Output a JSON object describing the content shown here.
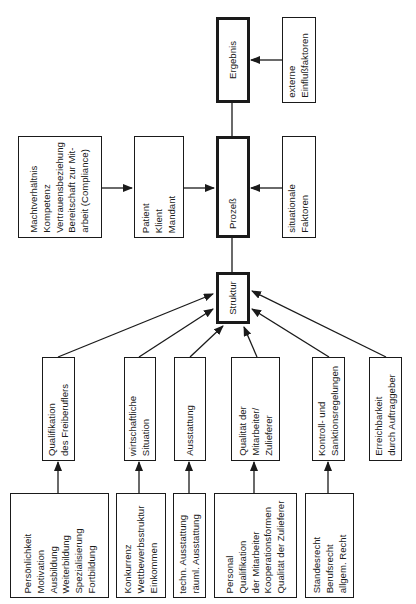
{
  "diagram": {
    "nodes": {
      "ergebnis": {
        "lines": [
          "Ergebnis"
        ]
      },
      "externe": {
        "lines": [
          "externe",
          "Einflußfaktoren"
        ]
      },
      "macht": {
        "lines": [
          "Machtverhältnis",
          "Kompetenz",
          "Vertrauensbeziehung",
          "Bereitschaft zur Mit-",
          "arbeit (Compliance)"
        ]
      },
      "patient": {
        "lines": [
          "Patient",
          "Klient",
          "Mandant"
        ]
      },
      "prozess": {
        "lines": [
          "Prozeß"
        ]
      },
      "situationale": {
        "lines": [
          "situationale",
          "Faktoren"
        ]
      },
      "struktur": {
        "lines": [
          "Struktur"
        ]
      },
      "qualifikation": {
        "lines": [
          "Qualifikation",
          "des Freiberuflers"
        ]
      },
      "wirtschaftliche": {
        "lines": [
          "wirtschaftliche",
          "Situation"
        ]
      },
      "ausstattung": {
        "lines": [
          "Ausstattung"
        ]
      },
      "qualitaet": {
        "lines": [
          "Qualität der",
          "Mitarbeiter/",
          "Zulieferer"
        ]
      },
      "kontroll": {
        "lines": [
          "Kontroll- und",
          "Sanktionsregelungen"
        ]
      },
      "erreichbarkeit": {
        "lines": [
          "Erreichbarkeit",
          "durch Auftraggeber"
        ]
      },
      "persoenlichkeit": {
        "lines": [
          "Persönlichkeit",
          "Motivation",
          "Ausbildung",
          "Weiterbildung",
          "Spezialisierung",
          "Fortbildung"
        ]
      },
      "konkurrenz": {
        "lines": [
          "Konkurrenz",
          "Wettbewerbsstruktur",
          "Einkommen"
        ]
      },
      "techn": {
        "lines": [
          "techn. Ausstattung",
          "räuml. Ausstattung"
        ]
      },
      "personal": {
        "lines": [
          "Personal",
          "Qualifikation",
          "der Mitarbeiter",
          "Kooperationsformen",
          "Qualität der Zulieferer"
        ]
      },
      "standesrecht": {
        "lines": [
          "Standesrecht",
          "Berufsrecht",
          "allgem. Recht"
        ]
      }
    },
    "edges": [
      {
        "from": "externe",
        "to": "ergebnis",
        "arrow": true
      },
      {
        "from": "prozess",
        "to": "ergebnis",
        "arrow": false
      },
      {
        "from": "macht",
        "to": "patient",
        "arrow": true
      },
      {
        "from": "patient",
        "to": "prozess",
        "arrow": true
      },
      {
        "from": "situationale",
        "to": "prozess",
        "arrow": true
      },
      {
        "from": "struktur",
        "to": "prozess",
        "arrow": false
      },
      {
        "from": "qualifikation",
        "to": "struktur",
        "arrow": true
      },
      {
        "from": "wirtschaftliche",
        "to": "struktur",
        "arrow": true
      },
      {
        "from": "ausstattung",
        "to": "struktur",
        "arrow": true
      },
      {
        "from": "qualitaet",
        "to": "struktur",
        "arrow": true
      },
      {
        "from": "kontroll",
        "to": "struktur",
        "arrow": true
      },
      {
        "from": "erreichbarkeit",
        "to": "struktur",
        "arrow": true
      },
      {
        "from": "persoenlichkeit",
        "to": "qualifikation",
        "arrow": true
      },
      {
        "from": "konkurrenz",
        "to": "wirtschaftliche",
        "arrow": true
      },
      {
        "from": "techn",
        "to": "ausstattung",
        "arrow": true
      },
      {
        "from": "personal",
        "to": "qualitaet",
        "arrow": true
      },
      {
        "from": "standesrecht",
        "to": "kontroll",
        "arrow": true
      }
    ]
  }
}
